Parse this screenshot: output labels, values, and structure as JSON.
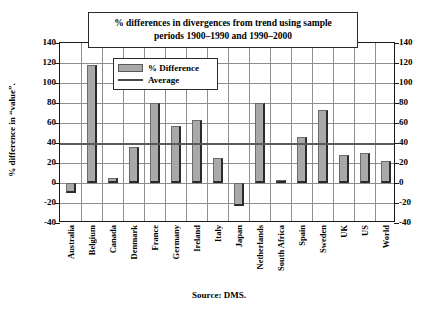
{
  "chart_data": {
    "type": "bar",
    "title": "% differences in divergences from trend using sample periods 1900–1990 and 1990–2000",
    "title_line1": "% differences in divergences from trend using sample",
    "title_line2": "periods 1900–1990 and 1990–2000",
    "xlabel": "",
    "ylabel": "% difference in “value”.",
    "ylim": [
      -40,
      140
    ],
    "ytick_step": 20,
    "yticks": [
      140,
      120,
      100,
      80,
      60,
      40,
      20,
      0,
      -20,
      -40
    ],
    "ytick_labels": [
      "140",
      "120",
      "100",
      "80",
      "60",
      "40",
      "20",
      "0",
      "-20",
      "-40"
    ],
    "grid": true,
    "legend_position": "upper-left-inside",
    "categories": [
      "Australia",
      "Belgium",
      "Canada",
      "Denmark",
      "France",
      "Germany",
      "Ireland",
      "Italy",
      "Japan",
      "Netherlands",
      "South Africa",
      "Spain",
      "Sweden",
      "UK",
      "US",
      "World"
    ],
    "series": [
      {
        "name": "% Difference",
        "type": "bar",
        "color": "#a9a9a9",
        "values": [
          -10,
          118,
          5,
          36,
          80,
          57,
          63,
          25,
          -23,
          80,
          3,
          46,
          73,
          28,
          30,
          22
        ]
      },
      {
        "name": "Average",
        "type": "line",
        "color": "#5a5a5a",
        "value": 40
      }
    ],
    "source": "Source: DMS."
  },
  "legend": {
    "items": [
      {
        "label": "% Difference",
        "marker": "bar-swatch"
      },
      {
        "label": "Average",
        "marker": "line-swatch"
      }
    ]
  },
  "footer": {
    "source": "Source: DMS."
  }
}
